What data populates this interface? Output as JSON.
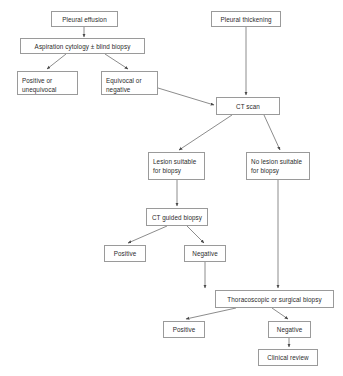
{
  "diagram": {
    "type": "flowchart",
    "canvas": {
      "width": 343,
      "height": 376
    },
    "style": {
      "box_border_color": "#9a9a9a",
      "box_fill_color": "#ffffff",
      "text_color": "#2b2b2b",
      "edge_color": "#6e6e6e",
      "background": "#ffffff"
    },
    "nodes": [
      {
        "id": "pleural-effusion",
        "label": "Pleural effusion",
        "x": 51,
        "y": 11,
        "w": 67,
        "h": 16,
        "align": "center",
        "lines": 1
      },
      {
        "id": "pleural-thickening",
        "label": "Pleural thickening",
        "x": 211,
        "y": 11,
        "w": 70,
        "h": 16,
        "align": "center",
        "lines": 1
      },
      {
        "id": "aspiration-cytology",
        "label": "Aspiration cytology ± blind biopsy",
        "x": 20,
        "y": 38,
        "w": 125,
        "h": 16,
        "align": "center",
        "lines": 1
      },
      {
        "id": "positive-unequivocal",
        "label": "Positive or\nunequivocal",
        "x": 17,
        "y": 71,
        "w": 61,
        "h": 24,
        "align": "left",
        "lines": 2
      },
      {
        "id": "equivocal-negative",
        "label": "Equivocal or\nnegative",
        "x": 101,
        "y": 71,
        "w": 57,
        "h": 24,
        "align": "left",
        "lines": 2
      },
      {
        "id": "ct-scan",
        "label": "CT scan",
        "x": 216,
        "y": 97,
        "w": 64,
        "h": 18,
        "align": "center",
        "lines": 1
      },
      {
        "id": "lesion-suitable",
        "label": "Lesion suitable\nfor biopsy",
        "x": 148,
        "y": 152,
        "w": 57,
        "h": 28,
        "align": "left",
        "lines": 2
      },
      {
        "id": "no-lesion-suitable",
        "label": "No lesion suitable\nfor biopsy",
        "x": 246,
        "y": 152,
        "w": 64,
        "h": 28,
        "align": "left",
        "lines": 2
      },
      {
        "id": "ct-guided-biopsy",
        "label": "CT guided biopsy",
        "x": 146,
        "y": 208,
        "w": 62,
        "h": 18,
        "align": "center",
        "lines": 1
      },
      {
        "id": "biopsy-positive",
        "label": "Positive",
        "x": 104,
        "y": 245,
        "w": 42,
        "h": 17,
        "align": "center",
        "lines": 1
      },
      {
        "id": "biopsy-negative",
        "label": "Negative",
        "x": 184,
        "y": 245,
        "w": 42,
        "h": 17,
        "align": "center",
        "lines": 1
      },
      {
        "id": "thoracoscopic-biopsy",
        "label": "Thoracoscopic or surgical biopsy",
        "x": 215,
        "y": 290,
        "w": 119,
        "h": 18,
        "align": "center",
        "lines": 1
      },
      {
        "id": "surgical-positive",
        "label": "Positive",
        "x": 163,
        "y": 321,
        "w": 42,
        "h": 17,
        "align": "center",
        "lines": 1
      },
      {
        "id": "surgical-negative",
        "label": "Negative",
        "x": 268,
        "y": 321,
        "w": 43,
        "h": 17,
        "align": "center",
        "lines": 1
      },
      {
        "id": "clinical-review",
        "label": "Clinical review",
        "x": 258,
        "y": 349,
        "w": 60,
        "h": 17,
        "align": "center",
        "lines": 1
      }
    ],
    "edges": [
      {
        "id": "e1",
        "from": "pleural-effusion",
        "to": "aspiration-cytology",
        "points": "84,27 84,37",
        "arrow": true
      },
      {
        "id": "e2",
        "from": "aspiration-cytology",
        "to": "positive-unequivocal",
        "points": "66,54 47,69",
        "arrow": true
      },
      {
        "id": "e3",
        "from": "aspiration-cytology",
        "to": "equivocal-negative",
        "points": "105,54 128,69",
        "arrow": true
      },
      {
        "id": "e4",
        "from": "pleural-thickening",
        "to": "ct-scan",
        "points": "246,27 246,95",
        "arrow": true
      },
      {
        "id": "e5",
        "from": "equivocal-negative",
        "to": "ct-scan",
        "points": "158,88 214,105",
        "arrow": true
      },
      {
        "id": "e6",
        "from": "ct-scan",
        "to": "lesion-suitable",
        "points": "232,115 179,150",
        "arrow": true
      },
      {
        "id": "e7",
        "from": "ct-scan",
        "to": "no-lesion-suitable",
        "points": "264,115 280,150",
        "arrow": true
      },
      {
        "id": "e8",
        "from": "lesion-suitable",
        "to": "ct-guided-biopsy",
        "points": "177,180 177,206",
        "arrow": true
      },
      {
        "id": "e9",
        "from": "ct-guided-biopsy",
        "to": "biopsy-positive",
        "points": "167,226 128,243",
        "arrow": true
      },
      {
        "id": "e10",
        "from": "ct-guided-biopsy",
        "to": "biopsy-negative",
        "points": "187,226 204,243",
        "arrow": true
      },
      {
        "id": "e11",
        "from": "biopsy-negative",
        "to": "thoracoscopic-biopsy",
        "points": "205,262 205,288",
        "arrow": true
      },
      {
        "id": "e12",
        "from": "no-lesion-suitable",
        "to": "thoracoscopic-biopsy",
        "points": "278,180 278,288",
        "arrow": true
      },
      {
        "id": "e13",
        "from": "thoracoscopic-biopsy",
        "to": "surgical-positive",
        "points": "236,308 186,319",
        "arrow": true
      },
      {
        "id": "e14",
        "from": "thoracoscopic-biopsy",
        "to": "surgical-negative",
        "points": "272,308 288,319",
        "arrow": true
      },
      {
        "id": "e15",
        "from": "surgical-negative",
        "to": "clinical-review",
        "points": "289,338 289,347",
        "arrow": true
      }
    ]
  }
}
